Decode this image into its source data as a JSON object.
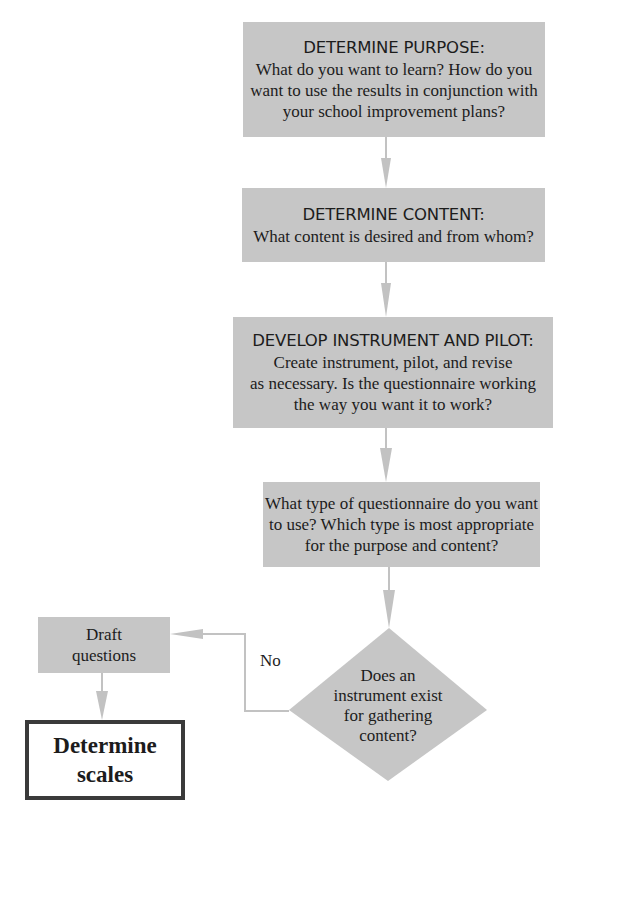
{
  "colors": {
    "box_fill": "#c6c6c6",
    "arrow": "#c0c0c0",
    "final_border": "#3a3a3a",
    "text": "#1c1c1c"
  },
  "flowchart": {
    "steps": [
      {
        "heading": "DETERMINE PURPOSE:",
        "body": "What do you want to learn? How do you\nwant to use the results in conjunction with\nyour school improvement plans?"
      },
      {
        "heading": "DETERMINE CONTENT:",
        "body": "What content is desired and from whom?"
      },
      {
        "heading": "DEVELOP INSTRUMENT AND PILOT:",
        "body": "Create instrument, pilot, and revise\nas necessary. Is the questionnaire working\nthe way you want it to work?"
      },
      {
        "heading": "",
        "body": "What type of questionnaire do you want\nto use? Which type is most appropriate\nfor the purpose and content?"
      }
    ],
    "decision": {
      "text": "Does an\ninstrument exist\nfor gathering\ncontent?",
      "no_label": "No"
    },
    "draft": {
      "text": "Draft\nquestions"
    },
    "final": {
      "text": "Determine\nscales"
    }
  }
}
